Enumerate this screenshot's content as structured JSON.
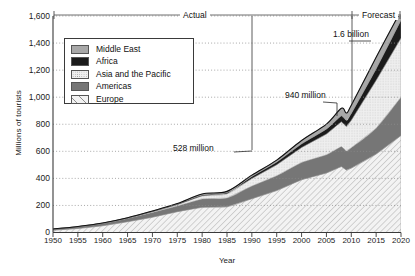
{
  "chart_data": {
    "type": "area",
    "title": "",
    "xlabel": "Year",
    "ylabel": "Millions of tourists",
    "xlim": [
      1950,
      2020
    ],
    "ylim": [
      0,
      1600
    ],
    "grid": true,
    "legend_position": "top-left-inside",
    "stacked": true,
    "x_ticks": [
      "1950",
      "1955",
      "1960",
      "1965",
      "1970",
      "1975",
      "1980",
      "1985",
      "1990",
      "1995",
      "2000",
      "2005",
      "2010",
      "2015",
      "2020"
    ],
    "y_ticks": [
      "0",
      "200",
      "400",
      "600",
      "800",
      "1,000",
      "1,200",
      "1,400",
      "1,600"
    ],
    "legend": [
      {
        "label": "Middle East",
        "swatch": "light-gray"
      },
      {
        "label": "Africa",
        "swatch": "black"
      },
      {
        "label": "Asia and the Pacific",
        "swatch": "light-stipple"
      },
      {
        "label": "Americas",
        "swatch": "dark-gray"
      },
      {
        "label": "Europe",
        "swatch": "diagonal-hatch"
      }
    ],
    "x": [
      1950,
      1955,
      1960,
      1965,
      1970,
      1975,
      1980,
      1985,
      1990,
      1995,
      2000,
      2005,
      2008,
      2009,
      2010,
      2015,
      2020
    ],
    "series": [
      {
        "name": "Europe",
        "values": [
          17,
          30,
          50,
          80,
          113,
          154,
          186,
          190,
          250,
          310,
          390,
          440,
          487,
          462,
          476,
          580,
          717
        ]
      },
      {
        "name": "Americas",
        "values": [
          8,
          12,
          17,
          24,
          35,
          42,
          62,
          65,
          93,
          109,
          128,
          134,
          148,
          141,
          150,
          190,
          282
        ]
      },
      {
        "name": "Asia and the Pacific",
        "values": [
          0.2,
          0.5,
          1,
          2,
          6,
          10,
          23,
          31,
          56,
          82,
          110,
          154,
          184,
          181,
          204,
          355,
          438
        ]
      },
      {
        "name": "Africa",
        "values": [
          0.5,
          0.8,
          1,
          1.5,
          3,
          5,
          7,
          9,
          15,
          20,
          27,
          37,
          44,
          46,
          50,
          85,
          134
        ]
      },
      {
        "name": "Middle East",
        "values": [
          0.2,
          0.3,
          0.6,
          1,
          2,
          3,
          7,
          9,
          10,
          14,
          25,
          36,
          55,
          53,
          60,
          85,
          69
        ]
      }
    ],
    "totals": [
      26,
      44,
      70,
      109,
      159,
      214,
      285,
      304,
      424,
      535,
      680,
      801,
      918,
      883,
      940,
      1295,
      1640
    ],
    "annotations": [
      {
        "text": "Actual",
        "role": "range-bracket",
        "from": 1950,
        "to": 2010
      },
      {
        "text": "Forecast",
        "role": "range-bracket",
        "from": 2010,
        "to": 2020
      },
      {
        "text": "1.6 billion",
        "role": "callout",
        "year": 2020,
        "value": 1600
      },
      {
        "text": "940 million",
        "role": "callout",
        "year": 2010,
        "value": 940
      },
      {
        "text": "528 million",
        "role": "callout",
        "year": 1995,
        "value": 528
      }
    ]
  },
  "colors": {
    "middle_east": "#a8a8a8",
    "africa": "#1b1b1b",
    "asia_pacific": "#efefef",
    "americas": "#767676",
    "europe": "#f2f2f2",
    "axis": "#3a3a3a",
    "grid": "#8c8c8c",
    "text": "#1a1a1a"
  }
}
